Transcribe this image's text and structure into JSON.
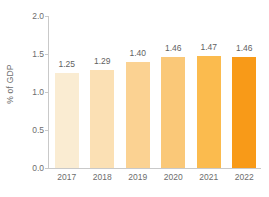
{
  "chart_data": {
    "type": "bar",
    "title": "",
    "subtitle": "",
    "xlabel": "",
    "ylabel": "% of GDP",
    "categories": [
      "2017",
      "2018",
      "2019",
      "2020",
      "2021",
      "2022"
    ],
    "values": [
      1.25,
      1.29,
      1.4,
      1.46,
      1.47,
      1.46
    ],
    "value_labels": [
      "1.25",
      "1.29",
      "1.40",
      "1.46",
      "1.47",
      "1.46"
    ],
    "bar_colors": [
      "#faecd2",
      "#fbe0b4",
      "#fbd292",
      "#fac878",
      "#fbbb4e",
      "#f89a18"
    ],
    "ylim": [
      0.0,
      2.0
    ],
    "yticks": [
      0.0,
      0.5,
      1.0,
      1.5,
      2.0
    ],
    "ytick_labels": [
      "0.0",
      "0.5",
      "1.0",
      "1.5",
      "2.0"
    ],
    "grid": false,
    "legend": null,
    "axis_color": "#c9c9c9",
    "text_color": "#6d6d6d",
    "background": "#ffffff"
  }
}
